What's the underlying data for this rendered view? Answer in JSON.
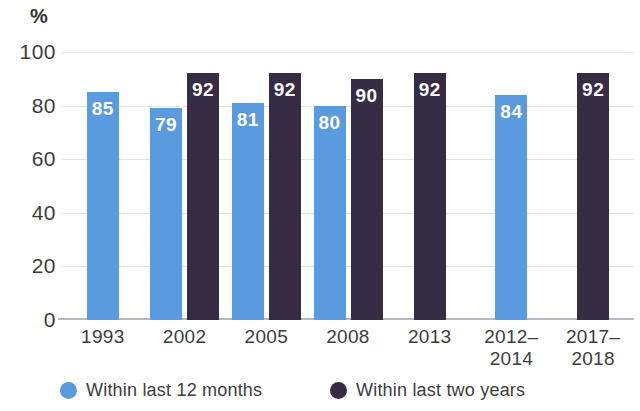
{
  "chart_data": {
    "type": "bar",
    "title": "",
    "subtitle": "",
    "xlabel": "",
    "ylabel": "%",
    "unit_label": "%",
    "ylim": [
      0,
      100
    ],
    "yticks": [
      100,
      80,
      60,
      40,
      20,
      0
    ],
    "ytick_labels": [
      "100",
      "80",
      "60",
      "40",
      "20",
      "0"
    ],
    "grid": true,
    "grid_axis": "y",
    "legend_position": "bottom",
    "categories": [
      "1993",
      "2002",
      "2005",
      "2008",
      "2013",
      "2012–\n2014",
      "2017–\n2018"
    ],
    "category_labels": [
      [
        "1993"
      ],
      [
        "2002"
      ],
      [
        "2005"
      ],
      [
        "2008"
      ],
      [
        "2013"
      ],
      [
        "2012–",
        "2014"
      ],
      [
        "2017–",
        "2018"
      ]
    ],
    "series": [
      {
        "name": "Within last 12 months",
        "color": "#5a9ade",
        "values": [
          85,
          79,
          81,
          80,
          null,
          84,
          null
        ],
        "value_labels": [
          "85",
          "79",
          "81",
          "80",
          "",
          "84",
          ""
        ]
      },
      {
        "name": "Within last two years",
        "color": "#362c43",
        "values": [
          null,
          92,
          92,
          90,
          92,
          null,
          92
        ],
        "value_labels": [
          "",
          "92",
          "92",
          "90",
          "92",
          "",
          "92"
        ]
      }
    ],
    "annotations": []
  },
  "legend": {
    "items": [
      {
        "label": "Within last 12 months",
        "color": "#5a9ade"
      },
      {
        "label": "Within last two years",
        "color": "#362c43"
      }
    ]
  },
  "colors": {
    "series_blue": "#5a9ade",
    "series_dark": "#362c43",
    "gridline": "#e4e2ee",
    "axis": "#b9b7c4",
    "text": "#3d3d3d",
    "background": "#ffffff",
    "value_label": "#ffffff"
  }
}
